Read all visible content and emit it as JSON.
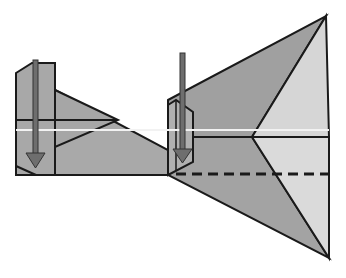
{
  "diagram": {
    "colors": {
      "background": "#ffffff",
      "paper_dark": "#a6a6a6",
      "paper_mid": "#b3b3b3",
      "paper_light": "#d9d9d9",
      "outline": "#1a1a1a",
      "arrow_fill": "#6e6e6e",
      "crease_highlight": "#f2f2f2"
    },
    "elements": [
      {
        "name": "left-flap",
        "description": "Narrow vertical flap on the left with downward arrow"
      },
      {
        "name": "middle-strip",
        "description": "Tapered strip connecting left flap to right body"
      },
      {
        "name": "right-body",
        "description": "Large triangular kite-like shape on the right"
      },
      {
        "name": "fold-arrow-left",
        "description": "Down arrow indicating fold on left flap"
      },
      {
        "name": "fold-arrow-right",
        "description": "Down arrow indicating fold on right small flap"
      },
      {
        "name": "valley-fold-line",
        "description": "Dashed line indicating valley fold"
      }
    ]
  }
}
